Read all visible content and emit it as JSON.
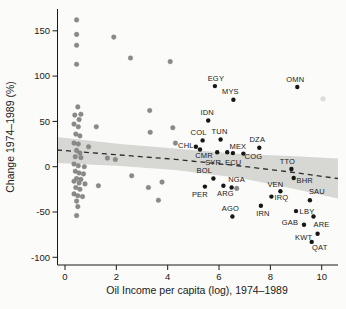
{
  "figure_name": "oil-income-regime-change-scatter",
  "chart_data": {
    "type": "scatter",
    "title": "",
    "xlabel": "Oil Income per capita (log), 1974–1989",
    "ylabel": "Change 1974–1989 (%)",
    "x_ticks": [
      0,
      2,
      4,
      6,
      8,
      10
    ],
    "y_ticks": [
      150,
      100,
      50,
      0,
      -50,
      -100
    ],
    "xlim": [
      -0.33,
      10.66
    ],
    "ylim": [
      -108,
      175
    ],
    "grid": false,
    "legend": "none",
    "colors": {
      "labeled_point": "#161616",
      "unlabeled_point": "#8a8a8a",
      "faint_point": "#dcdcda",
      "trend_line": "#2b2b2b",
      "confidence_band": "#d7d7d4",
      "axis": "#1a1a1a",
      "background": "#fbfbf9"
    },
    "series": [
      {
        "name": "labeled countries",
        "marker": "circle",
        "points": [
          {
            "label": "EGY",
            "x": 5.84,
            "y": 89,
            "lx": 1,
            "ly": -8
          },
          {
            "label": "MYS",
            "x": 6.56,
            "y": 74,
            "lx": -3,
            "ly": -8
          },
          {
            "label": "OMN",
            "x": 9.05,
            "y": 88,
            "lx": -2,
            "ly": -8
          },
          {
            "label": "IDN",
            "x": 5.58,
            "y": 51,
            "lx": -1,
            "ly": -8
          },
          {
            "label": "COL",
            "x": 5.36,
            "y": 29,
            "lx": -4,
            "ly": -8
          },
          {
            "label": "TUN",
            "x": 6.06,
            "y": 30,
            "lx": -1,
            "ly": -8
          },
          {
            "label": "DZA",
            "x": 7.57,
            "y": 21,
            "lx": -2,
            "ly": -8
          },
          {
            "label": "CHL",
            "x": 5.1,
            "y": 22,
            "lx": -10,
            "ly": -1
          },
          {
            "label": "CMR",
            "x": 5.26,
            "y": 19,
            "lx": 4,
            "ly": 6
          },
          {
            "label": "SYR",
            "x": 5.93,
            "y": 16,
            "lx": -4,
            "ly": 10
          },
          {
            "label": "ECU",
            "x": 6.32,
            "y": 16,
            "lx": 6,
            "ly": 10
          },
          {
            "label": "MEX",
            "x": 6.54,
            "y": 15,
            "lx": 5,
            "ly": -7
          },
          {
            "label": "COG",
            "x": 6.95,
            "y": 14.5,
            "lx": 10,
            "ly": 3
          },
          {
            "label": "TTO",
            "x": 8.82,
            "y": -2.5,
            "lx": -4,
            "ly": -8
          },
          {
            "label": "BOL",
            "x": 5.78,
            "y": -13,
            "lx": -9,
            "ly": -8
          },
          {
            "label": "BHR",
            "x": 8.91,
            "y": -12.5,
            "lx": 11,
            "ly": 2
          },
          {
            "label": "VEN",
            "x": 8.39,
            "y": -27,
            "lx": -5,
            "ly": -7
          },
          {
            "label": "NGA",
            "x": 6.49,
            "y": -23,
            "lx": 5,
            "ly": -8
          },
          {
            "label": "PER",
            "x": 5.45,
            "y": -22,
            "lx": -5,
            "ly": 8
          },
          {
            "label": "ARG",
            "x": 6.17,
            "y": -21,
            "lx": 2,
            "ly": 8
          },
          {
            "label": "IRQ",
            "x": 8.04,
            "y": -33,
            "lx": 10,
            "ly": 1
          },
          {
            "label": "SAU",
            "x": 9.54,
            "y": -37,
            "lx": 7,
            "ly": -9
          },
          {
            "label": "IRN",
            "x": 7.63,
            "y": -43,
            "lx": 2,
            "ly": 8
          },
          {
            "label": "AGO",
            "x": 6.52,
            "y": -55,
            "lx": -2,
            "ly": -8
          },
          {
            "label": "LBY",
            "x": 9.0,
            "y": -49,
            "lx": 11,
            "ly": 0
          },
          {
            "label": "ARE",
            "x": 9.68,
            "y": -55,
            "lx": 8,
            "ly": 8
          },
          {
            "label": "GAB",
            "x": 9.31,
            "y": -64,
            "lx": -14,
            "ly": -2
          },
          {
            "label": "KWT",
            "x": 9.84,
            "y": -74,
            "lx": -14,
            "ly": 4
          },
          {
            "label": "QAT",
            "x": 9.61,
            "y": -83,
            "lx": 8,
            "ly": 5
          }
        ]
      },
      {
        "name": "unlabeled countries",
        "marker": "circle",
        "points": [
          [
            0.45,
            162
          ],
          [
            0.45,
            146
          ],
          [
            0.45,
            134
          ],
          [
            0.45,
            113
          ],
          [
            1.9,
            143
          ],
          [
            2.55,
            120
          ],
          [
            4.1,
            116
          ],
          [
            0.5,
            66
          ],
          [
            0.62,
            58
          ],
          [
            0.38,
            57
          ],
          [
            0.55,
            52
          ],
          [
            3.3,
            62
          ],
          [
            0.35,
            47
          ],
          [
            0.52,
            44
          ],
          [
            1.22,
            44
          ],
          [
            3.32,
            38
          ],
          [
            4.2,
            43
          ],
          [
            4.3,
            26
          ],
          [
            0.42,
            36
          ],
          [
            0.58,
            34
          ],
          [
            0.35,
            26
          ],
          [
            0.52,
            25
          ],
          [
            0.92,
            22
          ],
          [
            0.45,
            18
          ],
          [
            0.58,
            15
          ],
          [
            0.4,
            11
          ],
          [
            0.62,
            10
          ],
          [
            1.65,
            9.5
          ],
          [
            1.96,
            8
          ],
          [
            0.35,
            3
          ],
          [
            0.52,
            1
          ],
          [
            0.75,
            0
          ],
          [
            0.4,
            -5
          ],
          [
            0.55,
            -7
          ],
          [
            0.72,
            -8
          ],
          [
            2.6,
            -10
          ],
          [
            0.45,
            -13
          ],
          [
            0.62,
            -14
          ],
          [
            0.35,
            -16
          ],
          [
            0.55,
            -18
          ],
          [
            0.78,
            -19
          ],
          [
            3.78,
            -17
          ],
          [
            0.42,
            -23
          ],
          [
            0.58,
            -25
          ],
          [
            1.3,
            -21
          ],
          [
            3.25,
            -23
          ],
          [
            6.69,
            -24
          ],
          [
            0.35,
            -30
          ],
          [
            0.5,
            -32
          ],
          [
            0.68,
            -33
          ],
          [
            0.45,
            -38
          ],
          [
            3.64,
            -37
          ],
          [
            0.5,
            -44
          ],
          [
            0.45,
            -54
          ]
        ]
      },
      {
        "name": "faint point",
        "marker": "circle",
        "points": [
          [
            10.05,
            75
          ]
        ]
      }
    ],
    "trend": {
      "style": "dashed",
      "points": [
        [
          -0.31,
          18.4
        ],
        [
          2.14,
          12.9
        ],
        [
          4.28,
          8.2
        ],
        [
          6.82,
          0.8
        ],
        [
          8.77,
          -5.8
        ],
        [
          10.63,
          -13.0
        ]
      ]
    },
    "confidence_band": {
      "top": [
        [
          -0.31,
          32.8
        ],
        [
          2.14,
          25.1
        ],
        [
          4.28,
          20.1
        ],
        [
          6.82,
          14.0
        ],
        [
          8.77,
          11.8
        ],
        [
          10.63,
          9.1
        ]
      ],
      "bottom": [
        [
          -0.31,
          4.1
        ],
        [
          2.14,
          0.8
        ],
        [
          4.28,
          -3.6
        ],
        [
          6.82,
          -12.5
        ],
        [
          8.77,
          -23.5
        ],
        [
          10.63,
          -35.1
        ]
      ]
    }
  }
}
